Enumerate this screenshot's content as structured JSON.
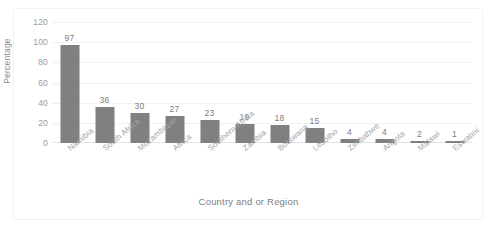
{
  "chart_data": {
    "type": "bar",
    "title": "",
    "xlabel": "Country and or Region",
    "ylabel": "Percentage",
    "categories": [
      "Namibia",
      "South Africa",
      "Mozambique",
      "Africa",
      "Southern Africa",
      "Zambia",
      "Botswana",
      "Lesotho",
      "Zimbabwe",
      "Angola",
      "Malawi",
      "Eswatini"
    ],
    "values": [
      97,
      36,
      30,
      27,
      23,
      19,
      18,
      15,
      4,
      4,
      2,
      1
    ],
    "ylim": [
      0,
      120
    ],
    "yticks": [
      0,
      20,
      40,
      60,
      80,
      100,
      120
    ],
    "ytick_labels": [
      "0",
      "20",
      "40",
      "60",
      "80",
      "100",
      "120"
    ],
    "grid": true,
    "legend": false,
    "bar_color": "#808080",
    "label_color": "#7c7c7c",
    "axis_color": "#a3a3a3",
    "data_labels": [
      "97",
      "36",
      "30",
      "27",
      "23",
      "19",
      "18",
      "15",
      "4",
      "4",
      "2",
      "1"
    ]
  }
}
